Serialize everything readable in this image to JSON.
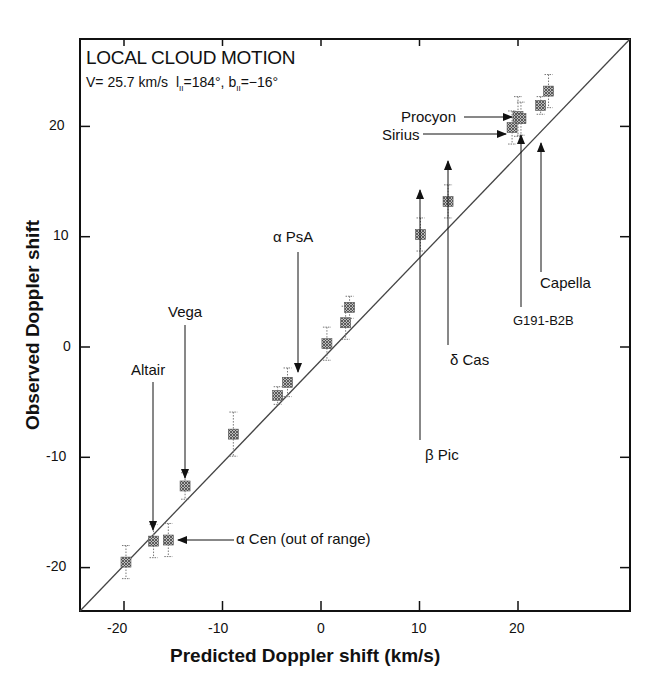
{
  "chart_data": {
    "type": "scatter",
    "title": "LOCAL CLOUD MOTION",
    "subtitle": {
      "velocity": "V= 25.7 km/s",
      "l_label": "l",
      "l_value": "=184°,",
      "b_label": "b",
      "b_value": "=−16°",
      "sub": "II"
    },
    "xlabel": "Predicted Doppler  shift (km/s)",
    "ylabel": "Observed Doppler shift",
    "xlim": [
      -24,
      28
    ],
    "ylim": [
      -24,
      28
    ],
    "xticks": [
      -20,
      -10,
      0,
      10,
      20
    ],
    "yticks": [
      -20,
      -10,
      0,
      10,
      20
    ],
    "grid": false,
    "reference_line": "y = x",
    "points": [
      {
        "x": -19.8,
        "y": -19.5,
        "err": 1.5,
        "label": ""
      },
      {
        "x": -17.0,
        "y": -17.6,
        "err": 1.5,
        "label": "Altair"
      },
      {
        "x": -15.5,
        "y": -17.5,
        "err": 1.5,
        "label": "α Cen (out of range)"
      },
      {
        "x": -13.8,
        "y": -12.6,
        "err": 1.2,
        "label": "Vega"
      },
      {
        "x": -8.9,
        "y": -7.9,
        "err": 2.0,
        "label": ""
      },
      {
        "x": -4.4,
        "y": -4.4,
        "err": 0.8,
        "label": ""
      },
      {
        "x": -3.4,
        "y": -3.2,
        "err": 1.3,
        "label": "α PsA"
      },
      {
        "x": 0.6,
        "y": 0.3,
        "err": 1.5,
        "label": ""
      },
      {
        "x": 2.5,
        "y": 2.2,
        "err": 1.5,
        "label": ""
      },
      {
        "x": 2.9,
        "y": 3.6,
        "err": 1.0,
        "label": ""
      },
      {
        "x": 10.1,
        "y": 10.2,
        "err": 1.5,
        "label": "β Pic"
      },
      {
        "x": 12.9,
        "y": 13.2,
        "err": 1.5,
        "label": "δ Cas"
      },
      {
        "x": 19.4,
        "y": 19.9,
        "err": 1.5,
        "label": "Sirius"
      },
      {
        "x": 20.0,
        "y": 20.9,
        "err": 1.8,
        "label": "Procyon"
      },
      {
        "x": 20.3,
        "y": 20.7,
        "err": 1.5,
        "label": "G191-B2B"
      },
      {
        "x": 22.3,
        "y": 21.9,
        "err": 0.8,
        "label": "Capella"
      },
      {
        "x": 23.1,
        "y": 23.2,
        "err": 1.5,
        "label": ""
      }
    ]
  },
  "labels": {
    "altair": "Altair",
    "vega": "Vega",
    "apsa": "α PsA",
    "acen": "α Cen (out of range)",
    "bpic": "β Pic",
    "dcas": "δ Cas",
    "sirius": "Sirius",
    "procyon": "Procyon",
    "g191": "G191-B2B",
    "capella": "Capella"
  },
  "ticks": {
    "x": [
      "-20",
      "-10",
      "0",
      "10",
      "20"
    ],
    "y": [
      "20",
      "10",
      "0",
      "-10",
      "-20"
    ]
  }
}
